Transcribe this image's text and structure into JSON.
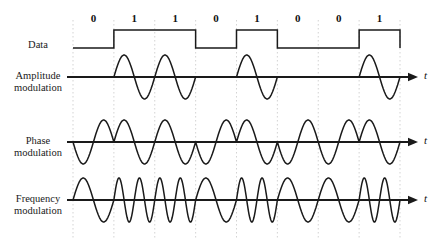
{
  "figure": {
    "background_color": "#ffffff",
    "stroke_color": "#1a1a1a",
    "gridline_color": "#c8c8c8",
    "axis_label": "t"
  },
  "data_stream": {
    "label": "Data",
    "bits": [
      "0",
      "1",
      "1",
      "0",
      "1",
      "0",
      "0",
      "1"
    ]
  },
  "rows": [
    {
      "name": "data",
      "label_line1": "Data",
      "label_line2": "",
      "type": "square",
      "axis_label": ""
    },
    {
      "name": "amplitude-modulation",
      "label_line1": "Amplitude",
      "label_line2": "modulation",
      "type": "ask",
      "axis_label": "t",
      "cycles_for_zero": 0,
      "cycles_for_one": 1
    },
    {
      "name": "phase-modulation",
      "label_line1": "Phase",
      "label_line2": "modulation",
      "type": "psk",
      "axis_label": "t",
      "cycles_for_zero": 1,
      "cycles_for_one": 1,
      "phase_invert_on": "0"
    },
    {
      "name": "frequency-modulation",
      "label_line1": "Frequency",
      "label_line2": "modulation",
      "type": "fsk",
      "axis_label": "t",
      "cycles_for_zero": 1,
      "cycles_for_one": 2
    }
  ],
  "geometry": {
    "plot_left": 73,
    "plot_right": 400,
    "bit_width": 40.875,
    "data_high_y": 30,
    "data_low_y": 48,
    "baselines": [
      77,
      142,
      200
    ],
    "amplitude": 22,
    "grid_top": 20,
    "grid_bottom": 240,
    "arrow_end": 418,
    "label_x": 5,
    "label_width": 66,
    "bit_label_y": 12
  }
}
